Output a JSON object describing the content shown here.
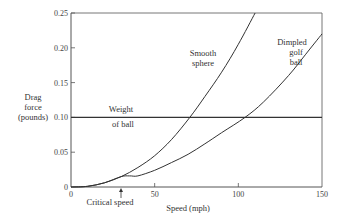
{
  "chart_data": {
    "type": "line",
    "title": "",
    "xlabel": "Speed (mph)",
    "ylabel": [
      "Drag",
      "force",
      "(pounds)"
    ],
    "xlim": [
      0,
      150
    ],
    "ylim": [
      0,
      0.25
    ],
    "grid": false,
    "x_ticks": [
      0,
      50,
      100,
      150
    ],
    "x_tick_labels": [
      "0",
      "50",
      "100",
      "150"
    ],
    "y_ticks": [
      0,
      0.05,
      0.1,
      0.15,
      0.2,
      0.25
    ],
    "y_tick_labels": [
      "0",
      "0.05",
      "0.10",
      "0.15",
      "0.20",
      "0.25"
    ],
    "series": [
      {
        "name": "Smooth sphere",
        "label_lines": [
          "Smooth",
          "sphere"
        ],
        "x": [
          0,
          10,
          20,
          30,
          40,
          50,
          60,
          71,
          80,
          90,
          100,
          110
        ],
        "values": [
          0,
          0.001,
          0.006,
          0.015,
          0.028,
          0.045,
          0.068,
          0.1,
          0.13,
          0.165,
          0.205,
          0.25
        ]
      },
      {
        "name": "Dimpled golf ball",
        "label_lines": [
          "Dimpled",
          "golf",
          "ball"
        ],
        "x": [
          0,
          10,
          20,
          30,
          35,
          40,
          50,
          60,
          70,
          80,
          90,
          104,
          115,
          130,
          140,
          150
        ],
        "values": [
          0,
          0.001,
          0.006,
          0.015,
          0.016,
          0.016,
          0.024,
          0.035,
          0.047,
          0.062,
          0.078,
          0.1,
          0.122,
          0.16,
          0.19,
          0.22
        ]
      },
      {
        "name": "Weight of ball",
        "label_lines": [
          "Weight",
          "of ball"
        ],
        "x": [
          0,
          150
        ],
        "values": [
          0.1,
          0.1
        ]
      }
    ],
    "annotations": [
      {
        "text": "Critical speed",
        "x": 30,
        "arrow": "up"
      }
    ]
  },
  "labels": {
    "ylabel_1": "Drag",
    "ylabel_2": "force",
    "ylabel_3": "(pounds)",
    "xlabel": "Speed (mph)",
    "critical": "Critical speed",
    "smooth_1": "Smooth",
    "smooth_2": "sphere",
    "dimpled_1": "Dimpled",
    "dimpled_2": "golf",
    "dimpled_3": "ball",
    "weight_1": "Weight",
    "weight_2": "of ball"
  },
  "colors": {
    "line": "#333333",
    "frame": "#555555"
  }
}
